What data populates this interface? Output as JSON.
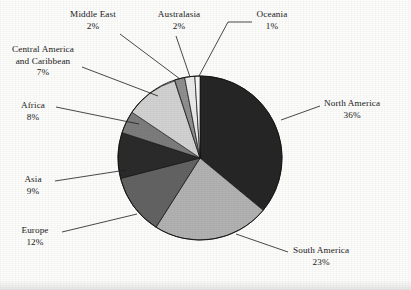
{
  "chart_data": {
    "type": "pie",
    "title": "",
    "subtitle": "",
    "xlabel": "",
    "ylabel": "",
    "legend_position": "none",
    "label_format": "name + percent",
    "start_angle_deg": 0,
    "direction": "clockwise",
    "categories": [
      "North America",
      "South America",
      "Europe",
      "Asia",
      "Africa",
      "Central America and Caribbean",
      "Middle East",
      "Australasia",
      "Oceania"
    ],
    "values": [
      36,
      23,
      12,
      9,
      8,
      7,
      2,
      2,
      1
    ],
    "value_labels": [
      "36%",
      "23%",
      "12%",
      "9%",
      "8%",
      "7%",
      "2%",
      "2%",
      "1%"
    ],
    "units": "percent",
    "total": 100,
    "colors": [
      "#262626",
      "#b2b2b2",
      "#636363",
      "#2b2b2b",
      "#7d7d7d",
      "#d2d2d2",
      "#8f8f8f",
      "#ebebeb",
      "#f7f7f7"
    ],
    "slices": [
      {
        "name": "North America",
        "value": 36,
        "label": "36%",
        "color": "#262626"
      },
      {
        "name": "South America",
        "value": 23,
        "label": "23%",
        "color": "#b2b2b2"
      },
      {
        "name": "Europe",
        "value": 12,
        "label": "12%",
        "color": "#636363"
      },
      {
        "name": "Asia",
        "value": 9,
        "label": "9%",
        "color": "#2b2b2b"
      },
      {
        "name": "Africa",
        "value": 8,
        "label": "8%",
        "color": "#7d7d7d"
      },
      {
        "name": "Central America and Caribbean",
        "value": 7,
        "label": "7%",
        "color": "#d2d2d2"
      },
      {
        "name": "Middle East",
        "value": 2,
        "label": "2%",
        "color": "#8f8f8f"
      },
      {
        "name": "Australasia",
        "value": 2,
        "label": "2%",
        "color": "#ebebeb"
      },
      {
        "name": "Oceania",
        "value": 1,
        "label": "1%",
        "color": "#f7f7f7"
      }
    ]
  },
  "labels": {
    "north_america": {
      "name": "North America",
      "value": "36%"
    },
    "south_america": {
      "name": "South America",
      "value": "23%"
    },
    "europe": {
      "name": "Europe",
      "value": "12%"
    },
    "asia": {
      "name": "Asia",
      "value": "9%"
    },
    "africa": {
      "name": "Africa",
      "value": "8%"
    },
    "central_america": {
      "name_line1": "Central America",
      "name_line2": "and Caribbean",
      "value": "7%"
    },
    "middle_east": {
      "name": "Middle East",
      "value": "2%"
    },
    "australasia": {
      "name": "Australasia",
      "value": "2%"
    },
    "oceania": {
      "name": "Oceania",
      "value": "1%"
    }
  },
  "style": {
    "background": "#fdfdfc",
    "outline": "#111111",
    "leader_line": "#1c1c1c"
  }
}
